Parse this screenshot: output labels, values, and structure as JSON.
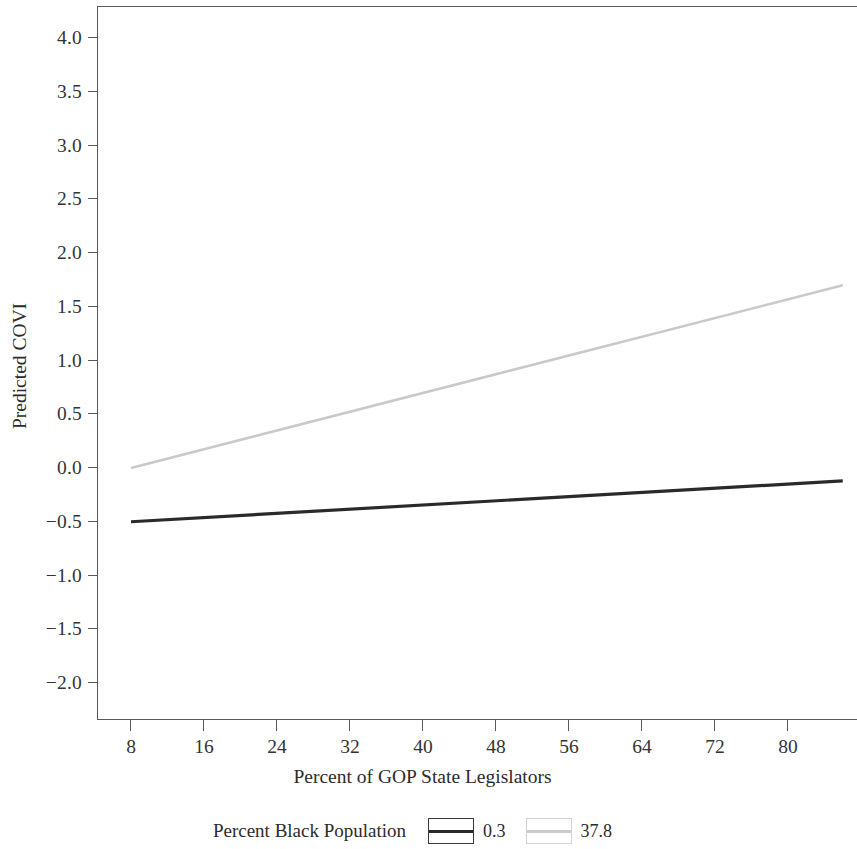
{
  "chart_data": {
    "type": "line",
    "title": "",
    "xlabel": "Percent of GOP State Legislators",
    "ylabel": "Predicted COVI",
    "xlim": [
      4.5,
      86.5
    ],
    "ylim": [
      -2.3,
      4.25
    ],
    "xticks": [
      "8",
      "16",
      "24",
      "32",
      "40",
      "48",
      "56",
      "64",
      "72",
      "80"
    ],
    "xtick_values": [
      8,
      16,
      24,
      32,
      40,
      48,
      56,
      64,
      72,
      80
    ],
    "yticks": [
      "4.0",
      "3.5",
      "3.0",
      "2.5",
      "2.0",
      "1.5",
      "1.0",
      "0.5",
      "0.0",
      "−0.5",
      "−1.0",
      "−1.5",
      "−2.0"
    ],
    "ytick_values": [
      4.0,
      3.5,
      3.0,
      2.5,
      2.0,
      1.5,
      1.0,
      0.5,
      0.0,
      -0.5,
      -1.0,
      -1.5,
      -2.0
    ],
    "grid": false,
    "legend_position": "bottom",
    "legend_title": "Percent Black Population",
    "series": [
      {
        "name": "0.3",
        "color": "#2a2a2a",
        "width": 3.2,
        "x": [
          8,
          86
        ],
        "y": [
          -0.5,
          -0.12
        ]
      },
      {
        "name": "37.8",
        "color": "#c9c9c9",
        "width": 2.6,
        "x": [
          8,
          86
        ],
        "y": [
          0.0,
          1.7
        ]
      }
    ]
  },
  "axes": {
    "frame_color": "#5a5a5a"
  },
  "legend": {
    "title": "Percent Black Population",
    "entries": [
      {
        "label": "0.3",
        "color": "#2a2a2a",
        "box_color": "#3a3a3a"
      },
      {
        "label": "37.8",
        "color": "#cccccc",
        "box_color": "#d2d2d2"
      }
    ]
  }
}
